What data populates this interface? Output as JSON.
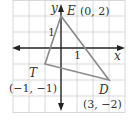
{
  "figure": {
    "type": "coordinate-plane-triangle",
    "unit_px": 16,
    "origin_px": [
      61,
      48
    ],
    "grid": {
      "x_range": [
        -3,
        4
      ],
      "y_range": [
        -4,
        3
      ],
      "color": "#cfcfcf"
    },
    "axes": {
      "x_label": "x",
      "y_label": "y",
      "x_tick_label": "1",
      "y_tick_label": "1",
      "color": "#222222"
    },
    "triangle": {
      "stroke_color": "#8a8a8a",
      "vertices": [
        {
          "name": "E",
          "coords_label": "(0, 2)",
          "x": 0,
          "y": 2
        },
        {
          "name": "T",
          "coords_label": "(−1, −1)",
          "x": -1,
          "y": -1
        },
        {
          "name": "D",
          "coords_label": "(3, −2)",
          "x": 3,
          "y": -2
        }
      ]
    }
  }
}
